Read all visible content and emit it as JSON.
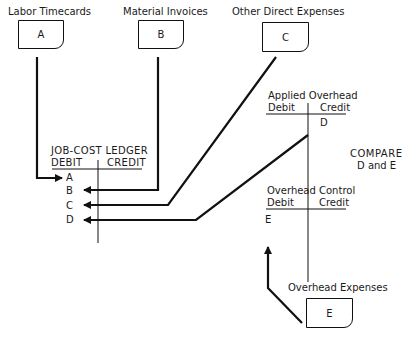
{
  "sources": {
    "labor": {
      "title": "Labor Timecards",
      "letter": "A"
    },
    "material": {
      "title": "Material Invoices",
      "letter": "B"
    },
    "other": {
      "title": "Other Direct Expenses",
      "letter": "C"
    },
    "overhead_expenses": {
      "title": "Overhead Expenses",
      "letter": "E"
    }
  },
  "job_cost_ledger": {
    "title": "JOB-COST LEDGER",
    "debit": "DEBIT",
    "credit": "CREDIT",
    "entries": [
      "A",
      "B",
      "C",
      "D"
    ]
  },
  "applied_overhead": {
    "title": "Applied Overhead",
    "debit": "Debit",
    "credit": "Credit",
    "credit_entry": "D"
  },
  "overhead_control": {
    "title": "Overhead Control",
    "debit": "Debit",
    "credit": "Credit",
    "debit_entry": "E"
  },
  "compare": {
    "line1": "COMPARE",
    "line2": "D and E"
  }
}
